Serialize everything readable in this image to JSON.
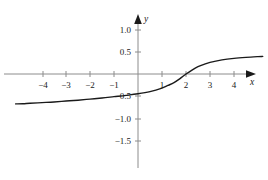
{
  "figure": {
    "background_color": "#ffffff",
    "axis_color": "#808080",
    "curve_color": "#1a1a1a",
    "text_color": "#1a1a1a"
  },
  "axes": {
    "x_axis_name": "x",
    "y_axis_name": "y",
    "x_arrow": "arrow-right-icon",
    "y_arrow": "arrow-up-icon"
  },
  "chart_data": {
    "type": "line",
    "title": "",
    "xlabel": "x",
    "ylabel": "y",
    "grid": false,
    "legend": false,
    "xlim": [
      -5.1,
      5.4
    ],
    "ylim": [
      -1.85,
      1.2
    ],
    "xticks": [
      -4,
      -3,
      -2,
      -1,
      1,
      2,
      3,
      4
    ],
    "xtick_labels": [
      "−4",
      "−3",
      "−2",
      "−1",
      "1",
      "2",
      "3",
      "4"
    ],
    "yticks": [
      -1.5,
      -1.0,
      -0.5,
      0.5,
      1.0
    ],
    "ytick_labels": [
      "−1.5",
      "−1.0",
      "−0.5",
      "0.5",
      "1.0"
    ],
    "x_axis_position": 0,
    "y_axis_position": 0,
    "series": [
      {
        "name": "curve",
        "shape": "increasing-sigmoid",
        "x_intercept": 2,
        "y_intercept": -0.45,
        "x": [
          -5.1,
          -4.8,
          -4.5,
          -4.0,
          -3.5,
          -3.0,
          -2.5,
          -2.0,
          -1.5,
          -1.0,
          -0.5,
          0.0,
          0.5,
          1.0,
          1.25,
          1.5,
          1.75,
          2.0,
          2.25,
          2.5,
          2.75,
          3.0,
          3.5,
          4.0,
          4.5,
          5.0,
          5.2
        ],
        "y": [
          -0.68,
          -0.675,
          -0.665,
          -0.65,
          -0.635,
          -0.615,
          -0.595,
          -0.57,
          -0.545,
          -0.515,
          -0.485,
          -0.45,
          -0.4,
          -0.32,
          -0.26,
          -0.195,
          -0.105,
          0.0,
          0.09,
          0.165,
          0.22,
          0.265,
          0.32,
          0.355,
          0.378,
          0.395,
          0.4
        ]
      }
    ]
  }
}
